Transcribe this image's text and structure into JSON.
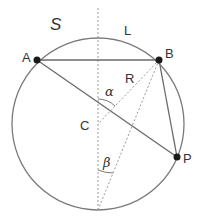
{
  "diagram": {
    "colors": {
      "stroke": "#7a7a7a",
      "dashed": "#9a9a9a",
      "point": "#1a1a1a",
      "text": "#333333"
    },
    "circle": {
      "cx": 98,
      "cy": 124,
      "r": 86,
      "label": "S"
    },
    "points": {
      "A": {
        "x": 37,
        "y": 60,
        "label": "A"
      },
      "B": {
        "x": 159,
        "y": 60,
        "label": "B"
      },
      "P": {
        "x": 177,
        "y": 157,
        "label": "P"
      },
      "C": {
        "x": 98,
        "y": 124,
        "label": "C"
      },
      "bottom": {
        "x": 98,
        "y": 210
      }
    },
    "labels": {
      "set": "S",
      "arc": "L",
      "radius": "R",
      "angle_center": "α",
      "angle_inscribed": "β",
      "center": "C"
    }
  }
}
